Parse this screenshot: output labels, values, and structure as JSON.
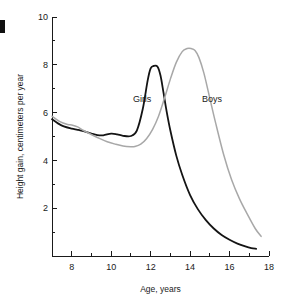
{
  "chart_data": {
    "type": "line",
    "title": "",
    "xlabel": "Age, years",
    "ylabel": "Height gain, centimeters per year",
    "xlim": [
      7,
      18
    ],
    "ylim": [
      0,
      10
    ],
    "xticks": [
      8,
      10,
      12,
      14,
      16,
      18
    ],
    "xtick_labels": [
      "8",
      "10",
      "12",
      "14",
      "16",
      "18"
    ],
    "xminor_ticks": [
      7,
      9,
      11,
      13,
      15,
      17
    ],
    "yticks": [
      2,
      4,
      6,
      8,
      10
    ],
    "ytick_labels": [
      "2",
      "4",
      "6",
      "8",
      "10"
    ],
    "yminor_ticks": [
      1,
      3,
      5,
      7,
      9
    ],
    "grid": false,
    "legend_position": "inline-annotations",
    "series": [
      {
        "name": "Girls",
        "color": "#141414",
        "label_text": "Girls",
        "label_x": 11.1,
        "label_y": 6.45,
        "peak_age": 12.2,
        "peak_value": 7.95,
        "x": [
          7.0,
          7.3,
          7.6,
          8.0,
          8.3,
          8.6,
          9.0,
          9.3,
          9.6,
          10.0,
          10.3,
          10.6,
          11.0,
          11.3,
          11.6,
          11.85,
          12.0,
          12.15,
          12.35,
          12.5,
          12.65,
          12.8,
          13.0,
          13.3,
          13.6,
          14.0,
          14.4,
          14.8,
          15.2,
          15.6,
          16.0,
          16.4,
          16.8,
          17.1,
          17.35
        ],
        "y": [
          5.72,
          5.55,
          5.42,
          5.33,
          5.28,
          5.22,
          5.12,
          5.06,
          5.05,
          5.12,
          5.09,
          5.03,
          5.02,
          5.25,
          6.15,
          7.35,
          7.85,
          7.95,
          7.92,
          7.55,
          6.85,
          6.1,
          5.25,
          4.2,
          3.4,
          2.55,
          1.95,
          1.5,
          1.15,
          0.88,
          0.68,
          0.52,
          0.4,
          0.33,
          0.3
        ]
      },
      {
        "name": "Boys",
        "color": "#a8a8a8",
        "label_text": "Boys",
        "label_x": 14.6,
        "label_y": 6.45,
        "peak_age": 14.0,
        "peak_value": 8.65,
        "x": [
          7.0,
          7.4,
          7.8,
          8.0,
          8.3,
          8.6,
          9.0,
          9.4,
          9.8,
          10.2,
          10.6,
          11.0,
          11.2,
          11.5,
          11.8,
          12.1,
          12.4,
          12.7,
          13.0,
          13.3,
          13.6,
          13.85,
          14.05,
          14.25,
          14.45,
          14.7,
          15.0,
          15.3,
          15.7,
          16.1,
          16.5,
          16.9,
          17.3,
          17.6
        ],
        "y": [
          5.85,
          5.62,
          5.5,
          5.48,
          5.4,
          5.25,
          5.08,
          4.92,
          4.78,
          4.68,
          4.6,
          4.57,
          4.58,
          4.68,
          4.92,
          5.3,
          5.85,
          6.6,
          7.4,
          8.1,
          8.55,
          8.68,
          8.68,
          8.6,
          8.3,
          7.65,
          6.6,
          5.55,
          4.25,
          3.2,
          2.4,
          1.75,
          1.15,
          0.82
        ]
      }
    ]
  },
  "annotations": {
    "edge_mark": ""
  }
}
